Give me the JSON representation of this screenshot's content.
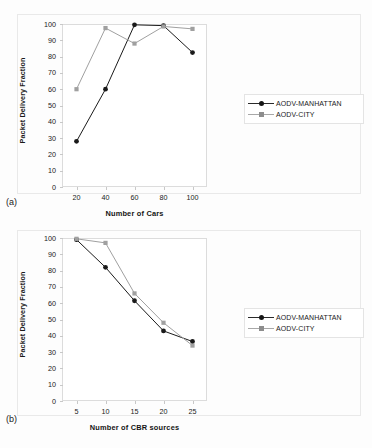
{
  "figure": {
    "panel_a_tag": "(a)",
    "panel_b_tag": "(b)"
  },
  "chart_data": [
    {
      "type": "line",
      "panel": "(a)",
      "title": "",
      "xlabel": "Number of Cars",
      "ylabel": "Packet Delivery Fraction",
      "x": [
        20,
        40,
        60,
        80,
        100
      ],
      "xticks": [
        "20",
        "40",
        "60",
        "80",
        "100"
      ],
      "yticks": [
        "0",
        "10",
        "20",
        "30",
        "40",
        "50",
        "60",
        "70",
        "80",
        "90",
        "100"
      ],
      "xlim": [
        10,
        110
      ],
      "ylim": [
        0,
        100
      ],
      "grid": false,
      "legend_position": "right-outside",
      "series": [
        {
          "name": "AODV-MANHATTAN",
          "color": "#1a1a1a",
          "marker": "diamond",
          "values": [
            28,
            60,
            99.5,
            99,
            82.5
          ]
        },
        {
          "name": "AODV-CITY",
          "color": "#a0a0a0",
          "marker": "square",
          "values": [
            60,
            97.5,
            88,
            98.5,
            97
          ]
        }
      ]
    },
    {
      "type": "line",
      "panel": "(b)",
      "title": "",
      "xlabel": "Number of CBR sources",
      "ylabel": "Packet Delivery Fraction",
      "x": [
        5,
        10,
        15,
        20,
        25
      ],
      "xticks": [
        "5",
        "10",
        "15",
        "20",
        "25"
      ],
      "yticks": [
        "0",
        "10",
        "20",
        "30",
        "40",
        "50",
        "60",
        "70",
        "80",
        "90",
        "100"
      ],
      "xlim": [
        2.5,
        27.5
      ],
      "ylim": [
        0,
        100
      ],
      "grid": false,
      "legend_position": "right-outside",
      "series": [
        {
          "name": "AODV-MANHATTAN",
          "color": "#1a1a1a",
          "marker": "diamond",
          "values": [
            99,
            82,
            61.5,
            43,
            36.5
          ]
        },
        {
          "name": "AODV-CITY",
          "color": "#a0a0a0",
          "marker": "square",
          "values": [
            99.5,
            97,
            66,
            48,
            34
          ]
        }
      ]
    }
  ]
}
